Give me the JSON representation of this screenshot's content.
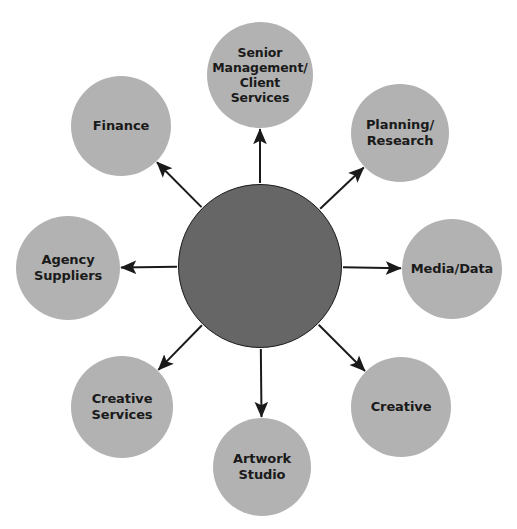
{
  "diagram": {
    "type": "hub-and-spoke",
    "title": "",
    "background_color": "#ffffff",
    "hub": {
      "label": "",
      "color": "#666666",
      "border_color": "#1a1a1a",
      "cx": 260,
      "cy": 266,
      "r": 82
    },
    "satellite_color": "#b2b2b2",
    "text_color": "#1a1a1a",
    "arrow_color": "#1a1a1a",
    "nodes": [
      {
        "id": "senior-management-client-services",
        "label": "Senior\nManagement/\nClient Services",
        "cx": 260,
        "cy": 75,
        "r": 53,
        "font": "label-sm",
        "angle_deg": -90
      },
      {
        "id": "planning-research",
        "label": "Planning/\nResearch",
        "cx": 400,
        "cy": 133,
        "r": 49,
        "font": "label-md",
        "angle_deg": -45
      },
      {
        "id": "media-data",
        "label": "Media/Data",
        "cx": 452,
        "cy": 269,
        "r": 50,
        "font": "label-md",
        "angle_deg": 0
      },
      {
        "id": "creative",
        "label": "Creative",
        "cx": 401,
        "cy": 407,
        "r": 50,
        "font": "label-md",
        "angle_deg": 45
      },
      {
        "id": "artwork-studio",
        "label": "Artwork\nStudio",
        "cx": 262,
        "cy": 467,
        "r": 49,
        "font": "label-md",
        "angle_deg": 90
      },
      {
        "id": "creative-services",
        "label": "Creative\nServices",
        "cx": 122,
        "cy": 407,
        "r": 51,
        "font": "label-md",
        "angle_deg": 135
      },
      {
        "id": "agency-suppliers",
        "label": "Agency\nSuppliers",
        "cx": 68,
        "cy": 268,
        "r": 52,
        "font": "label-md",
        "angle_deg": 180
      },
      {
        "id": "finance",
        "label": "Finance",
        "cx": 121,
        "cy": 126,
        "r": 50,
        "font": "label-md",
        "angle_deg": -135
      }
    ],
    "arrows": [
      {
        "from": "hub",
        "to": "senior-management-client-services",
        "direction": "outward"
      },
      {
        "from": "hub",
        "to": "planning-research",
        "direction": "outward"
      },
      {
        "from": "hub",
        "to": "media-data",
        "direction": "outward"
      },
      {
        "from": "hub",
        "to": "creative",
        "direction": "outward"
      },
      {
        "from": "hub",
        "to": "artwork-studio",
        "direction": "outward"
      },
      {
        "from": "hub",
        "to": "creative-services",
        "direction": "outward"
      },
      {
        "from": "hub",
        "to": "agency-suppliers",
        "direction": "outward"
      },
      {
        "from": "hub",
        "to": "finance",
        "direction": "outward"
      }
    ]
  }
}
